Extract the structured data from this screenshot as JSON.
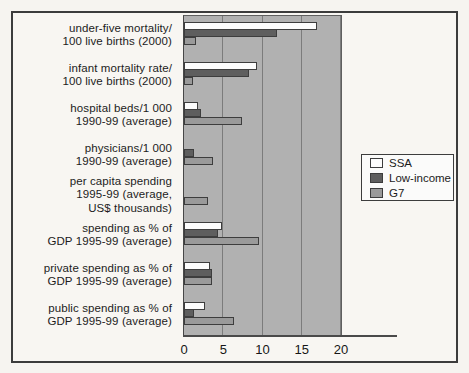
{
  "figure": {
    "paper_color": "#f6f4f0",
    "frame_border_color": "#3c3c3c",
    "plot_background": "#b1b1b1",
    "gridline_color": "#7c7c7c"
  },
  "chart_data": {
    "type": "bar",
    "orientation": "horizontal",
    "title": "",
    "xlabel": "",
    "ylabel": "",
    "xlim": [
      0,
      20
    ],
    "xticks": [
      "0",
      "5",
      "10",
      "15",
      "20"
    ],
    "gridlines_at": [
      5,
      10,
      15,
      20
    ],
    "grid": "on",
    "legend_position": "right",
    "categories": [
      "under-five mortality/\n100 live births (2000)",
      "infant mortality rate/\n100 live births (2000)",
      "hospital beds/1 000\n1990-99 (average)",
      "physicians/1 000\n1990-99 (average)",
      "per capita spending\n1995-99 (average,\nUS$ thousands)",
      "spending as % of\nGDP 1995-99 (average)",
      "private spending as % of\nGDP 1995-99 (average)",
      "public spending as % of\nGDP 1995-99 (average)"
    ],
    "series": [
      {
        "name": "SSA",
        "color": "#fcfcfc",
        "values": [
          16.8,
          9.2,
          1.6,
          0,
          0,
          4.7,
          3.2,
          2.5
        ]
      },
      {
        "name": "Low-income",
        "color": "#5e5e5e",
        "values": [
          11.7,
          8.2,
          2.0,
          1.1,
          0,
          4.2,
          3.4,
          1.1
        ]
      },
      {
        "name": "G7",
        "color": "#9a9a9a",
        "values": [
          1.4,
          1.0,
          7.3,
          3.6,
          2.9,
          9.4,
          3.5,
          6.2
        ]
      }
    ]
  }
}
